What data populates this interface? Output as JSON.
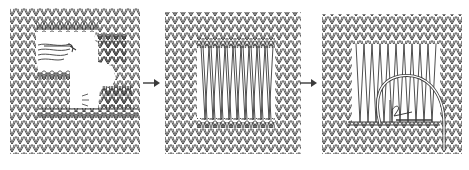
{
  "diagram": {
    "colors": {
      "ink": "#3a3a3a",
      "background": "#ffffff"
    },
    "panels": [
      {
        "id": 1,
        "description": "Damaged knit fabric with a hole, loose stitches and unravelled yarn ends"
      },
      {
        "id": 2,
        "description": "Vertical threads stretched across the hole between top and bottom stitch loops"
      },
      {
        "id": 3,
        "description": "Needle and yarn weaving horizontally through the vertical threads"
      }
    ],
    "arrows": [
      {
        "from": 1,
        "to": 2,
        "icon": "arrow-right-icon"
      },
      {
        "from": 2,
        "to": 3,
        "icon": "arrow-right-icon"
      }
    ]
  }
}
